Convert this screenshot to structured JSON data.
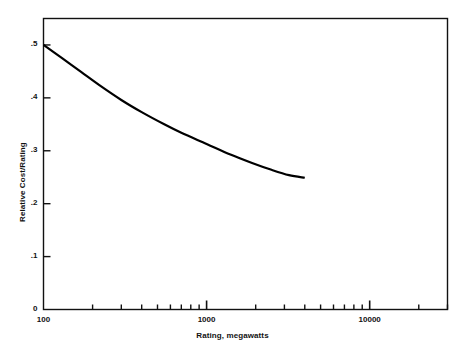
{
  "chart_data": {
    "type": "line",
    "title": "",
    "xlabel": "Rating, megawatts",
    "ylabel": "Relative Cost/Rating",
    "xscale": "log",
    "yscale": "linear",
    "xlim": [
      100,
      30000
    ],
    "ylim": [
      0,
      0.55
    ],
    "grid": false,
    "legend": null,
    "xticks_major": [
      {
        "value": 100,
        "label": "100"
      },
      {
        "value": 1000,
        "label": "1000"
      },
      {
        "value": 10000,
        "label": "10000"
      }
    ],
    "xticks_minor": [
      200,
      300,
      400,
      500,
      600,
      700,
      800,
      900,
      2000,
      3000,
      4000,
      5000,
      6000,
      7000,
      8000,
      9000,
      20000,
      30000
    ],
    "yticks": [
      {
        "value": 0,
        "label": "0"
      },
      {
        "value": 0.1,
        "label": ".1"
      },
      {
        "value": 0.2,
        "label": ".2"
      },
      {
        "value": 0.3,
        "label": ".3"
      },
      {
        "value": 0.4,
        "label": ".4"
      },
      {
        "value": 0.5,
        "label": ".5"
      }
    ],
    "series": [
      {
        "name": "Relative Cost/Rating",
        "color": "#000000",
        "linewidth": 2.2,
        "x": [
          100,
          130,
          170,
          220,
          300,
          400,
          550,
          700,
          1000,
          1400,
          1900,
          2500,
          3200,
          4000
        ],
        "y": [
          0.5,
          0.475,
          0.449,
          0.424,
          0.396,
          0.373,
          0.35,
          0.334,
          0.313,
          0.293,
          0.277,
          0.264,
          0.254,
          0.249
        ]
      }
    ]
  }
}
